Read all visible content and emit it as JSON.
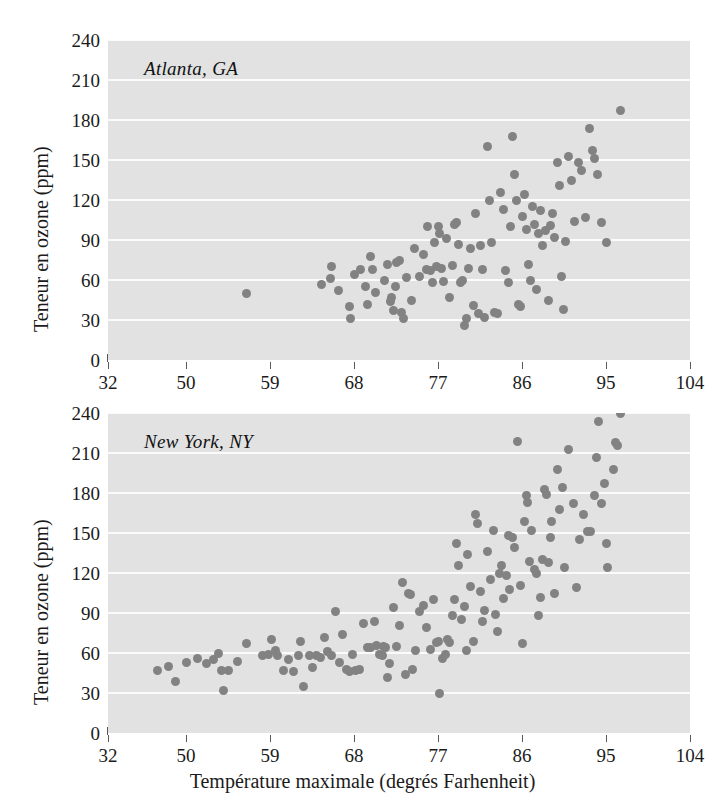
{
  "figure": {
    "xlabel": "Température maximale (degrés Farhenheit)",
    "ylabel": "Teneur en ozone (ppm)",
    "point_color": "#828282",
    "plot_background": "#e2e2e2",
    "gridline_color": "#fbfbfb"
  },
  "chart_data": [
    {
      "type": "scatter",
      "title": "Atlanta, GA",
      "xlabel": "Température maximale (degrés Farhenheit)",
      "ylabel": "Teneur en ozone (ppm)",
      "xlim": [
        32,
        104
      ],
      "ylim": [
        0,
        240
      ],
      "xticks": [
        32,
        50,
        59,
        68,
        77,
        86,
        95,
        104
      ],
      "yticks": [
        0,
        30,
        60,
        90,
        120,
        150,
        180,
        210,
        240
      ],
      "grid": true,
      "legend": "none",
      "points": [
        [
          56.5,
          50
        ],
        [
          64.5,
          57
        ],
        [
          65.5,
          61
        ],
        [
          65.6,
          70
        ],
        [
          66.3,
          52
        ],
        [
          67.5,
          40
        ],
        [
          67.6,
          31
        ],
        [
          68.0,
          64
        ],
        [
          68.7,
          68
        ],
        [
          69.2,
          55
        ],
        [
          69.4,
          42
        ],
        [
          69.8,
          78
        ],
        [
          70.0,
          68
        ],
        [
          70.3,
          51
        ],
        [
          71.3,
          60
        ],
        [
          71.6,
          72
        ],
        [
          71.9,
          44
        ],
        [
          72.0,
          47
        ],
        [
          72.2,
          37
        ],
        [
          72.4,
          55
        ],
        [
          72.6,
          73
        ],
        [
          72.9,
          75
        ],
        [
          73.1,
          36
        ],
        [
          73.3,
          31
        ],
        [
          73.6,
          62
        ],
        [
          74.2,
          45
        ],
        [
          74.5,
          84
        ],
        [
          75.0,
          63
        ],
        [
          75.4,
          79
        ],
        [
          75.8,
          68
        ],
        [
          75.9,
          100
        ],
        [
          76.2,
          67
        ],
        [
          76.4,
          58
        ],
        [
          76.6,
          88
        ],
        [
          76.8,
          70
        ],
        [
          77.0,
          100
        ],
        [
          77.2,
          95
        ],
        [
          77.4,
          69
        ],
        [
          77.6,
          59
        ],
        [
          77.9,
          91
        ],
        [
          78.2,
          47
        ],
        [
          78.5,
          71
        ],
        [
          78.8,
          102
        ],
        [
          79.0,
          103
        ],
        [
          79.2,
          87
        ],
        [
          79.4,
          58
        ],
        [
          79.6,
          60
        ],
        [
          79.8,
          26
        ],
        [
          80.0,
          31
        ],
        [
          80.3,
          69
        ],
        [
          80.5,
          84
        ],
        [
          80.8,
          41
        ],
        [
          81.0,
          110
        ],
        [
          81.3,
          35
        ],
        [
          81.5,
          86
        ],
        [
          81.8,
          68
        ],
        [
          82.0,
          32
        ],
        [
          82.3,
          160
        ],
        [
          82.5,
          120
        ],
        [
          82.7,
          88
        ],
        [
          83.0,
          36
        ],
        [
          83.4,
          35
        ],
        [
          83.7,
          126
        ],
        [
          84.0,
          113
        ],
        [
          84.2,
          67
        ],
        [
          84.5,
          58
        ],
        [
          84.8,
          100
        ],
        [
          85.0,
          168
        ],
        [
          85.2,
          139
        ],
        [
          85.4,
          120
        ],
        [
          85.6,
          42
        ],
        [
          85.8,
          40
        ],
        [
          86.0,
          108
        ],
        [
          86.3,
          124
        ],
        [
          86.5,
          98
        ],
        [
          86.7,
          72
        ],
        [
          86.9,
          60
        ],
        [
          87.1,
          115
        ],
        [
          87.3,
          102
        ],
        [
          87.6,
          53
        ],
        [
          87.8,
          95
        ],
        [
          88.0,
          112
        ],
        [
          88.2,
          86
        ],
        [
          88.5,
          97
        ],
        [
          88.8,
          45
        ],
        [
          89.0,
          101
        ],
        [
          89.3,
          110
        ],
        [
          89.5,
          92
        ],
        [
          89.8,
          148
        ],
        [
          90.0,
          131
        ],
        [
          90.2,
          63
        ],
        [
          90.4,
          38
        ],
        [
          90.7,
          89
        ],
        [
          91.0,
          153
        ],
        [
          91.3,
          135
        ],
        [
          91.6,
          104
        ],
        [
          92.0,
          148
        ],
        [
          92.4,
          142
        ],
        [
          92.8,
          107
        ],
        [
          93.2,
          174
        ],
        [
          93.5,
          157
        ],
        [
          93.8,
          151
        ],
        [
          94.1,
          139
        ],
        [
          94.5,
          103
        ],
        [
          95.0,
          88
        ],
        [
          96.5,
          187
        ]
      ]
    },
    {
      "type": "scatter",
      "title": "New York, NY",
      "xlabel": "Température maximale (degrés Farhenheit)",
      "ylabel": "Teneur en ozone (ppm)",
      "xlim": [
        32,
        104
      ],
      "ylim": [
        0,
        240
      ],
      "xticks": [
        32,
        50,
        59,
        68,
        77,
        86,
        95,
        104
      ],
      "yticks": [
        0,
        30,
        60,
        90,
        120,
        150,
        180,
        210,
        240
      ],
      "grid": true,
      "legend": "none",
      "points": [
        [
          43.5,
          47
        ],
        [
          46.0,
          50
        ],
        [
          47.5,
          39
        ],
        [
          50.0,
          53
        ],
        [
          51.2,
          56
        ],
        [
          52.2,
          52
        ],
        [
          52.9,
          55
        ],
        [
          53.5,
          60
        ],
        [
          53.8,
          47
        ],
        [
          54.0,
          32
        ],
        [
          54.5,
          47
        ],
        [
          55.5,
          54
        ],
        [
          56.5,
          67
        ],
        [
          58.2,
          58
        ],
        [
          58.8,
          59
        ],
        [
          59.2,
          70
        ],
        [
          59.6,
          62
        ],
        [
          59.8,
          58
        ],
        [
          60.4,
          47
        ],
        [
          61.0,
          55
        ],
        [
          61.5,
          46
        ],
        [
          62.0,
          58
        ],
        [
          62.3,
          69
        ],
        [
          62.6,
          35
        ],
        [
          63.2,
          58
        ],
        [
          63.6,
          49
        ],
        [
          64.0,
          58
        ],
        [
          64.4,
          57
        ],
        [
          64.8,
          72
        ],
        [
          65.2,
          61
        ],
        [
          65.6,
          58
        ],
        [
          66.0,
          91
        ],
        [
          66.4,
          53
        ],
        [
          66.8,
          74
        ],
        [
          67.2,
          48
        ],
        [
          67.5,
          46
        ],
        [
          67.8,
          59
        ],
        [
          68.2,
          47
        ],
        [
          68.6,
          48
        ],
        [
          69.0,
          82
        ],
        [
          69.4,
          64
        ],
        [
          69.8,
          64
        ],
        [
          70.2,
          84
        ],
        [
          70.4,
          66
        ],
        [
          70.7,
          59
        ],
        [
          71.0,
          58
        ],
        [
          71.2,
          65
        ],
        [
          71.4,
          64
        ],
        [
          71.6,
          42
        ],
        [
          71.8,
          52
        ],
        [
          72.2,
          94
        ],
        [
          72.6,
          65
        ],
        [
          72.9,
          81
        ],
        [
          73.2,
          113
        ],
        [
          73.5,
          44
        ],
        [
          73.8,
          105
        ],
        [
          74.0,
          104
        ],
        [
          74.3,
          48
        ],
        [
          74.6,
          62
        ],
        [
          75.0,
          91
        ],
        [
          75.4,
          96
        ],
        [
          75.8,
          79
        ],
        [
          76.2,
          63
        ],
        [
          76.5,
          100
        ],
        [
          76.8,
          68
        ],
        [
          77.0,
          69
        ],
        [
          77.2,
          30
        ],
        [
          77.5,
          56
        ],
        [
          77.8,
          59
        ],
        [
          78.0,
          70
        ],
        [
          78.2,
          68
        ],
        [
          78.5,
          88
        ],
        [
          78.8,
          100
        ],
        [
          79.0,
          142
        ],
        [
          79.2,
          126
        ],
        [
          79.5,
          85
        ],
        [
          79.8,
          95
        ],
        [
          80.0,
          62
        ],
        [
          80.2,
          134
        ],
        [
          80.5,
          110
        ],
        [
          80.8,
          69
        ],
        [
          81.0,
          164
        ],
        [
          81.2,
          157
        ],
        [
          81.5,
          106
        ],
        [
          81.8,
          84
        ],
        [
          82.0,
          92
        ],
        [
          82.3,
          136
        ],
        [
          82.6,
          115
        ],
        [
          82.9,
          152
        ],
        [
          83.2,
          89
        ],
        [
          83.4,
          76
        ],
        [
          83.6,
          120
        ],
        [
          83.8,
          126
        ],
        [
          84.0,
          101
        ],
        [
          84.3,
          118
        ],
        [
          84.5,
          148
        ],
        [
          84.7,
          108
        ],
        [
          85.0,
          147
        ],
        [
          85.2,
          139
        ],
        [
          85.5,
          219
        ],
        [
          85.8,
          111
        ],
        [
          86.0,
          67
        ],
        [
          86.3,
          159
        ],
        [
          86.5,
          178
        ],
        [
          86.6,
          173
        ],
        [
          86.8,
          129
        ],
        [
          87.0,
          152
        ],
        [
          87.3,
          123
        ],
        [
          87.5,
          120
        ],
        [
          87.8,
          88
        ],
        [
          88.0,
          102
        ],
        [
          88.2,
          130
        ],
        [
          88.4,
          183
        ],
        [
          88.6,
          179
        ],
        [
          88.8,
          128
        ],
        [
          89.0,
          147
        ],
        [
          89.2,
          159
        ],
        [
          89.5,
          105
        ],
        [
          89.8,
          198
        ],
        [
          90.0,
          168
        ],
        [
          90.3,
          184
        ],
        [
          90.6,
          124
        ],
        [
          91.0,
          213
        ],
        [
          91.5,
          172
        ],
        [
          91.8,
          109
        ],
        [
          92.2,
          145
        ],
        [
          92.6,
          164
        ],
        [
          93.0,
          151
        ],
        [
          93.3,
          151
        ],
        [
          93.8,
          178
        ],
        [
          94.0,
          207
        ],
        [
          94.2,
          234
        ],
        [
          94.5,
          172
        ],
        [
          94.8,
          187
        ],
        [
          95.0,
          142
        ],
        [
          95.2,
          124
        ],
        [
          95.8,
          198
        ],
        [
          96.0,
          218
        ],
        [
          96.2,
          216
        ],
        [
          96.5,
          240
        ]
      ]
    }
  ]
}
